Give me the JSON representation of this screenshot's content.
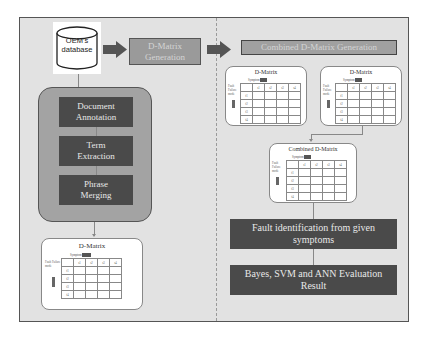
{
  "diagram": {
    "database": {
      "line1": "OEM's",
      "line2": "database"
    },
    "dmatrix_generation": {
      "line1": "D-Matrix",
      "line2": "Generation"
    },
    "pipeline_steps": [
      {
        "line1": "Document",
        "line2": "Annotation"
      },
      {
        "line1": "Term",
        "line2": "Extraction"
      },
      {
        "line1": "Phrase",
        "line2": "Merging"
      }
    ],
    "combined_generation": "Combined D-Matrix Generation",
    "matrix_cards": {
      "left_bottom": {
        "title": "D-Matrix"
      },
      "right_top_1": {
        "title": "D-Matrix"
      },
      "right_top_2": {
        "title": "D-Matrix"
      },
      "combined": {
        "title": "Combined D-Matrix"
      }
    },
    "matrix_labels": {
      "symptom_header": "Symptom",
      "side_label": "Fault Failure mode",
      "col_headers": [
        "s1",
        "s2",
        "s3",
        "s4"
      ],
      "row_headers": [
        "f1",
        "f2",
        "f3",
        "f4"
      ]
    },
    "fault_identification": {
      "line1": "Fault identification from given",
      "line2": "symptoms"
    },
    "evaluation": {
      "line1": "Bayes, SVM and ANN Evaluation",
      "line2": "Result"
    }
  },
  "colors": {
    "panel_bg": "#e2e2e2",
    "dark_box": "#4a4a4a",
    "light_box": "#9a9a9a",
    "group_bg": "#a3a3a3",
    "arrow": "#555555"
  }
}
